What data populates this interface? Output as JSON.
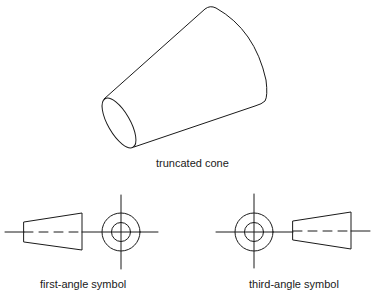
{
  "figure": {
    "cone": {
      "label": "truncated cone"
    },
    "first_angle": {
      "label": "first-angle symbol",
      "layout": "side view left, end view right"
    },
    "third_angle": {
      "label": "third-angle symbol",
      "layout": "end view left, side view right"
    },
    "colors": {
      "line": "#1a1a1a",
      "background": "#ffffff"
    }
  }
}
